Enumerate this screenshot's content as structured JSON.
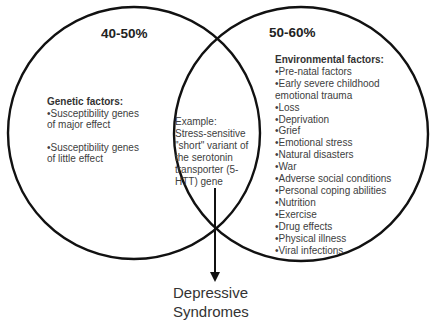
{
  "diagram": {
    "type": "venn",
    "colors": {
      "stroke": "#111111",
      "text": "#404040",
      "background": "#ffffff"
    },
    "left_set": {
      "percentage": "40-50%",
      "heading": "Genetic factors:",
      "items": [
        "•Susceptibility genes",
        "of major effect",
        "•Susceptibility genes",
        "of little effect"
      ]
    },
    "intersection": {
      "lines": [
        "Example:",
        "Stress-sensitive",
        "\"short\" variant of",
        "the serotonin",
        "transporter (5-",
        "HTT) gene"
      ]
    },
    "right_set": {
      "percentage": "50-60%",
      "heading": "Environmental factors:",
      "items": [
        "•Pre-natal factors",
        "•Early severe childhood",
        "emotional trauma",
        "•Loss",
        "•Deprivation",
        "•Grief",
        "•Emotional stress",
        "•Natural disasters",
        "•War",
        "•Adverse social conditions",
        "•Personal coping abilities",
        "•Nutrition",
        "•Exercise",
        "•Drug effects",
        "•Physical illness",
        "•Viral infections"
      ]
    },
    "outcome": {
      "lines": [
        "Depressive",
        "Syndromes"
      ]
    }
  }
}
